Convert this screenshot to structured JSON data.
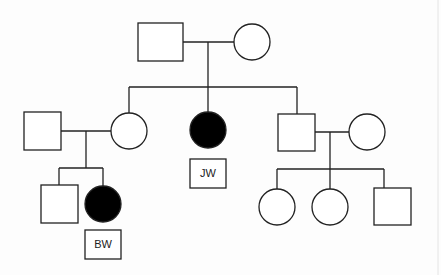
{
  "diagram": {
    "type": "pedigree",
    "colors": {
      "line": "#222222",
      "affected_fill": "#000000",
      "unaffected_fill": "#ffffff",
      "background": "#fdfdfd"
    },
    "generations": [
      {
        "level": "I",
        "individuals": [
          {
            "id": "I-1",
            "sex": "male",
            "affected": false
          },
          {
            "id": "I-2",
            "sex": "female",
            "affected": false
          }
        ]
      },
      {
        "level": "II",
        "individuals": [
          {
            "id": "II-spouse-1",
            "sex": "male",
            "affected": false,
            "married_in": true
          },
          {
            "id": "II-1",
            "sex": "female",
            "affected": false
          },
          {
            "id": "II-2",
            "sex": "female",
            "affected": true,
            "label": "JW"
          },
          {
            "id": "II-3",
            "sex": "male",
            "affected": false
          },
          {
            "id": "II-spouse-3",
            "sex": "female",
            "affected": false,
            "married_in": true
          }
        ]
      },
      {
        "level": "III",
        "individuals": [
          {
            "id": "III-1",
            "sex": "male",
            "affected": false,
            "parents": "II-1"
          },
          {
            "id": "III-2",
            "sex": "female",
            "affected": true,
            "label": "BW",
            "parents": "II-1"
          },
          {
            "id": "III-3",
            "sex": "female",
            "affected": false,
            "parents": "II-3"
          },
          {
            "id": "III-4",
            "sex": "female",
            "affected": false,
            "parents": "II-3"
          },
          {
            "id": "III-5",
            "sex": "male",
            "affected": false,
            "parents": "II-3"
          }
        ]
      }
    ],
    "labels": {
      "jw": "JW",
      "bw": "BW"
    }
  }
}
